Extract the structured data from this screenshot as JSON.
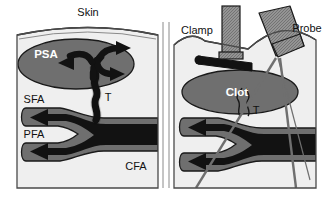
{
  "figure": {
    "background_color": "#ffffff",
    "panel_count": 2
  },
  "colors": {
    "background": "#ffffff",
    "tissue": "#efefef",
    "vessel_wall": "#6f6f6f",
    "clot": "#6f6f6f",
    "psa_sac": "#6f6f6f",
    "blood_flow": "#121212",
    "instrument": "#8f8f8f",
    "instrument_hatch": "#6a6a6a",
    "outline": "#1a1a1a",
    "panel_border": "#4a4a4a",
    "label_dark": "#111111",
    "label_light": "#ffffff"
  },
  "left_panel": {
    "name": "untreated-pseudoaneurysm",
    "labels": {
      "skin": "Skin",
      "psa": "PSA",
      "sfa": "SFA",
      "pfa": "PFA",
      "cfa": "CFA",
      "tract": "T"
    }
  },
  "right_panel": {
    "name": "compression-with-clot",
    "labels": {
      "clamp": "Clamp",
      "probe": "Probe",
      "clot": "Clot",
      "tract": "T"
    }
  }
}
